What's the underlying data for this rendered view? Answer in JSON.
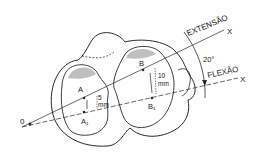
{
  "diagram": {
    "labels": {
      "extension": "EXTENSÃO",
      "flexion": "FLEXÃO",
      "axis_x_top": "X",
      "axis_x_bottom": "X",
      "angle": "20°",
      "origin": "0",
      "point_a": "A",
      "point_a1": "A₁",
      "point_b": "B",
      "point_b1": "B₁",
      "dist_a_value": "5",
      "dist_a_unit": "mm",
      "dist_b_value": "10",
      "dist_b_unit": "mm"
    },
    "colors": {
      "line": "#2a2a2a",
      "background": "#ffffff"
    }
  }
}
